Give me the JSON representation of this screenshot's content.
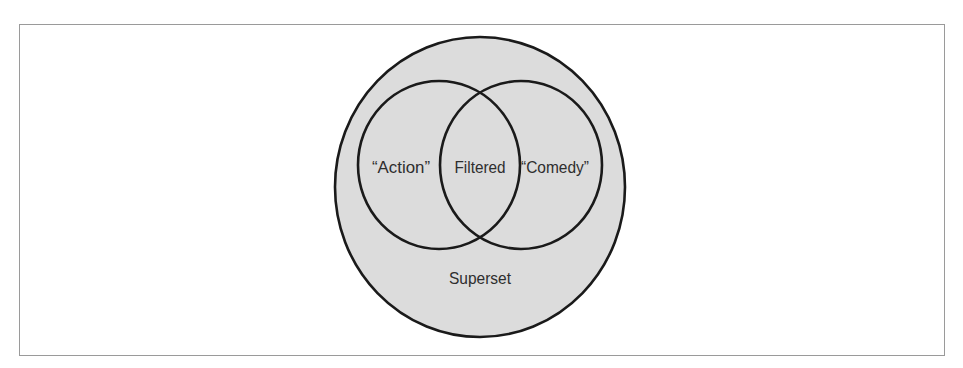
{
  "diagram": {
    "type": "venn",
    "colors": {
      "frame_border": "#9a9a9a",
      "superset_fill": "#dcdcdc",
      "stroke": "#1a1a1a",
      "text": "#2e2e2e",
      "background": "#ffffff"
    },
    "sets": {
      "superset": {
        "label": "Superset"
      },
      "left": {
        "label": "“Action”"
      },
      "intersection": {
        "label": "Filtered"
      },
      "right": {
        "label": "“Comedy”"
      }
    }
  }
}
